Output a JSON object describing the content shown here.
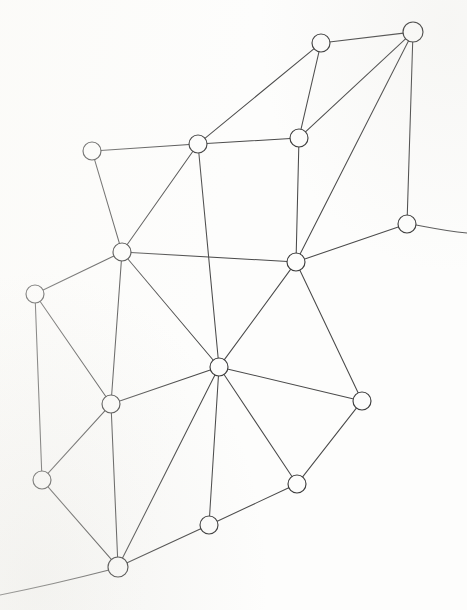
{
  "figure": {
    "kind": "planar-graph-diagram",
    "title": "",
    "background_color": "#fdfdfc",
    "node_fill": "#fdfdfc",
    "node_stroke": "#3d3d3d",
    "edge_stroke": "#4a4a4a",
    "node_radius": 9,
    "width": 467,
    "height": 610
  },
  "chart_data": {
    "type": "scatter",
    "title": "",
    "xlabel": "",
    "ylabel": "",
    "xlim": [
      0,
      467
    ],
    "ylim": [
      0,
      610
    ],
    "grid": false,
    "legend": "none",
    "node_count": 17,
    "edge_count": 33,
    "nodes": [
      {
        "id": "n1",
        "label": "",
        "x": 321,
        "y": 43,
        "r": 9,
        "degree": 3
      },
      {
        "id": "n2",
        "label": "",
        "x": 413,
        "y": 32,
        "r": 10,
        "degree": 4
      },
      {
        "id": "n3",
        "label": "",
        "x": 299,
        "y": 138,
        "r": 9,
        "degree": 4
      },
      {
        "id": "n4",
        "label": "",
        "x": 198,
        "y": 144,
        "r": 9,
        "degree": 5
      },
      {
        "id": "n5",
        "label": "",
        "x": 92,
        "y": 151,
        "r": 9,
        "degree": 2
      },
      {
        "id": "n6",
        "label": "",
        "x": 407,
        "y": 224,
        "r": 9,
        "degree": 3
      },
      {
        "id": "n7",
        "label": "",
        "x": 296,
        "y": 262,
        "r": 9,
        "degree": 7
      },
      {
        "id": "n8",
        "label": "",
        "x": 122,
        "y": 252,
        "r": 9,
        "degree": 6
      },
      {
        "id": "n9",
        "label": "",
        "x": 35,
        "y": 294,
        "r": 9,
        "degree": 3
      },
      {
        "id": "n10",
        "label": "",
        "x": 219,
        "y": 367,
        "r": 9,
        "degree": 8
      },
      {
        "id": "n11",
        "label": "",
        "x": 111,
        "y": 404,
        "r": 9,
        "degree": 5
      },
      {
        "id": "n12",
        "label": "",
        "x": 362,
        "y": 401,
        "r": 9,
        "degree": 3
      },
      {
        "id": "n13",
        "label": "",
        "x": 42,
        "y": 480,
        "r": 9,
        "degree": 3
      },
      {
        "id": "n14",
        "label": "",
        "x": 297,
        "y": 484,
        "r": 9,
        "degree": 3
      },
      {
        "id": "n15",
        "label": "",
        "x": 209,
        "y": 525,
        "r": 9,
        "degree": 3
      },
      {
        "id": "n16",
        "label": "",
        "x": 118,
        "y": 567,
        "r": 10,
        "degree": 5
      },
      {
        "id": "n17",
        "label": "",
        "x": 0,
        "y": 0,
        "r": 0,
        "degree": 0
      }
    ],
    "edges": [
      {
        "from": "n1",
        "to": "n2"
      },
      {
        "from": "n1",
        "to": "n3"
      },
      {
        "from": "n1",
        "to": "n4"
      },
      {
        "from": "n2",
        "to": "n3"
      },
      {
        "from": "n2",
        "to": "n7"
      },
      {
        "from": "n2",
        "to": "n6"
      },
      {
        "from": "n3",
        "to": "n4"
      },
      {
        "from": "n3",
        "to": "n7"
      },
      {
        "from": "n4",
        "to": "n5"
      },
      {
        "from": "n4",
        "to": "n8"
      },
      {
        "from": "n4",
        "to": "n10"
      },
      {
        "from": "n5",
        "to": "n8"
      },
      {
        "from": "n6",
        "to": "n7"
      },
      {
        "from": "n7",
        "to": "n8"
      },
      {
        "from": "n7",
        "to": "n10"
      },
      {
        "from": "n7",
        "to": "n12"
      },
      {
        "from": "n8",
        "to": "n9"
      },
      {
        "from": "n8",
        "to": "n10"
      },
      {
        "from": "n8",
        "to": "n11"
      },
      {
        "from": "n9",
        "to": "n11"
      },
      {
        "from": "n9",
        "to": "n13"
      },
      {
        "from": "n10",
        "to": "n11"
      },
      {
        "from": "n10",
        "to": "n12"
      },
      {
        "from": "n10",
        "to": "n14"
      },
      {
        "from": "n10",
        "to": "n15"
      },
      {
        "from": "n10",
        "to": "n16"
      },
      {
        "from": "n11",
        "to": "n13"
      },
      {
        "from": "n11",
        "to": "n16"
      },
      {
        "from": "n12",
        "to": "n14"
      },
      {
        "from": "n13",
        "to": "n16"
      },
      {
        "from": "n14",
        "to": "n15"
      },
      {
        "from": "n15",
        "to": "n16"
      }
    ],
    "boundary_curves": [
      {
        "id": "right-tail",
        "path": "M 416 225 C 432 228, 446 231, 467 233"
      },
      {
        "id": "bottom-tail",
        "path": "M 109 570 C 78 578, 40 587, 0 595"
      }
    ]
  }
}
